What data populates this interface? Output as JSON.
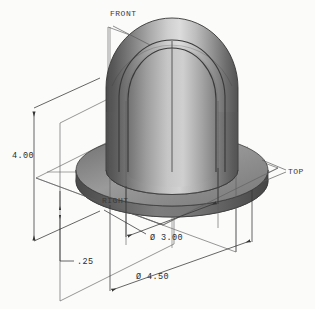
{
  "drawing": {
    "title": "Isometric sectioned dome cap with flange",
    "background_color": "#fbfbfa",
    "line_color": "#4a4a4a",
    "dim_line_color": "#3d3d3d",
    "text_color": "#2b2b2b"
  },
  "plane_labels": [
    {
      "id": "front",
      "text": "FRONT",
      "x": 110,
      "y": 16
    },
    {
      "id": "top",
      "text": "TOP",
      "x": 288,
      "y": 171
    },
    {
      "id": "right",
      "text": "RIGHT",
      "x": 102,
      "y": 203
    }
  ],
  "dimensions": [
    {
      "id": "height",
      "text": "4.00",
      "value": 4.0,
      "x": 12,
      "y": 155,
      "kind": "linear-vertical"
    },
    {
      "id": "flange-thickness",
      "text": ".25",
      "value": 0.25,
      "x": 78,
      "y": 263,
      "kind": "linear-vertical"
    },
    {
      "id": "bore-diameter",
      "text": "Ø 3.00",
      "value": 3.0,
      "x": 153,
      "y": 241,
      "kind": "diameter"
    },
    {
      "id": "flange-diameter",
      "text": "Ø 4.50",
      "value": 4.5,
      "x": 137,
      "y": 279,
      "kind": "diameter"
    }
  ],
  "shading": {
    "dome_dark": "#5d5d5d",
    "dome_mid": "#8e8e8e",
    "dome_light": "#d2d2d2",
    "dome_highlight": "#e6e6e6",
    "flange_top": "#8a8a8a",
    "flange_side_dark": "#4f4f4f",
    "flange_side_mid": "#6e6e6e",
    "interior_dark": "#5a5a5a",
    "interior_light": "#bcbcbc"
  }
}
